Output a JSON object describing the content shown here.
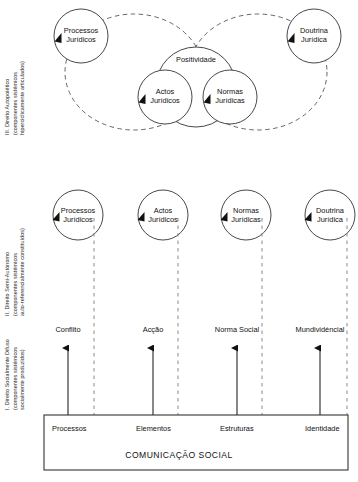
{
  "figure": {
    "stroke_color": "#333333",
    "dashed_color": "#555555",
    "text_color": "#111111"
  },
  "levels": {
    "top": {
      "id": "III",
      "line1": "III. Direito Autopoiético",
      "line2": "(componentes sistémicos",
      "line3": "hiperciclicamente articulados)"
    },
    "middle": {
      "id": "II",
      "line1": "II. Direito Semi-Autónomo",
      "line2": "(componentes sistémicos",
      "line3": "auto-referencialmente constituídos)"
    },
    "bottom": {
      "id": "I",
      "line1": "I. Direito Socialmente Difuso",
      "line2": "(componentes sistémicos",
      "line3": "socialmente produzidos)"
    }
  },
  "top_section": {
    "nodes": [
      {
        "line1": "Processos",
        "line2": "Jurídicos"
      },
      {
        "line1": "Actos",
        "line2": "Jurídicos"
      },
      {
        "line1": "Normas",
        "line2": "Jurídicas"
      },
      {
        "line1": "Doutrina",
        "line2": "Jurídica"
      }
    ],
    "enclosure_label": "Positividade"
  },
  "middle_section": {
    "nodes": [
      {
        "line1": "Processos",
        "line2": "Jurídicos"
      },
      {
        "line1": "Actos",
        "line2": "Jurídicos"
      },
      {
        "line1": "Normas",
        "line2": "Jurídicas"
      },
      {
        "line1": "Doutrina",
        "line2": "Jurídica"
      }
    ]
  },
  "bottom_section": {
    "arrow_labels": [
      "Conflito",
      "Acção",
      "Norma Social",
      "Mundividéncial"
    ],
    "box": {
      "columns": [
        "Processos",
        "Elementos",
        "Estruturas",
        "Identidade"
      ],
      "title": "COMUNICAÇÃO SOCIAL"
    }
  }
}
